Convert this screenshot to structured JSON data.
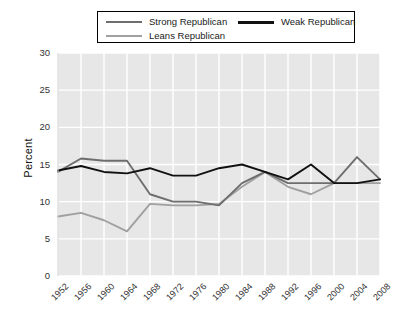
{
  "chart_data": {
    "type": "line",
    "title": "",
    "xlabel": "",
    "ylabel": "Percent",
    "ylim": [
      0,
      30
    ],
    "ytickstep": 5,
    "grid": true,
    "legend_position": "top",
    "x": [
      1952,
      1956,
      1960,
      1964,
      1968,
      1972,
      1976,
      1980,
      1984,
      1988,
      1992,
      1996,
      2000,
      2004,
      2008
    ],
    "xticklabels": [
      "1952",
      "1956",
      "1960",
      "1964",
      "1968",
      "1972",
      "1976",
      "1980",
      "1984",
      "1988",
      "1992",
      "1996",
      "2000",
      "2004",
      "2008"
    ],
    "yticklabels": [
      "0",
      "5",
      "10",
      "15",
      "20",
      "25",
      "30"
    ],
    "yticks": [
      0,
      5,
      10,
      15,
      20,
      25,
      30
    ],
    "series": [
      {
        "name": "Strong Republican",
        "color": "#6e6e6e",
        "values": [
          14.0,
          15.8,
          15.5,
          15.5,
          11.0,
          10.0,
          10.0,
          9.5,
          12.5,
          14.0,
          12.5,
          12.5,
          12.5,
          16.0,
          13.0
        ]
      },
      {
        "name": "Weak Republican",
        "color": "#111111",
        "values": [
          14.2,
          14.8,
          14.0,
          13.8,
          14.5,
          13.5,
          13.5,
          14.5,
          15.0,
          14.0,
          13.0,
          15.0,
          12.5,
          12.5,
          13.0
        ]
      },
      {
        "name": "Leans Republican",
        "color": "#a0a0a0",
        "values": [
          8.0,
          8.5,
          7.5,
          6.0,
          9.7,
          9.5,
          9.5,
          9.7,
          12.0,
          14.0,
          12.0,
          11.0,
          12.5,
          12.5,
          12.5
        ]
      }
    ]
  },
  "legend": {
    "entries": [
      {
        "label": "Strong Republican"
      },
      {
        "label": "Weak Republican"
      },
      {
        "label": "Leans Republican"
      }
    ]
  },
  "style": {
    "plot_background": "#e7e7e7",
    "gridline_color": "#ffffff",
    "page_background": "#ffffff"
  }
}
